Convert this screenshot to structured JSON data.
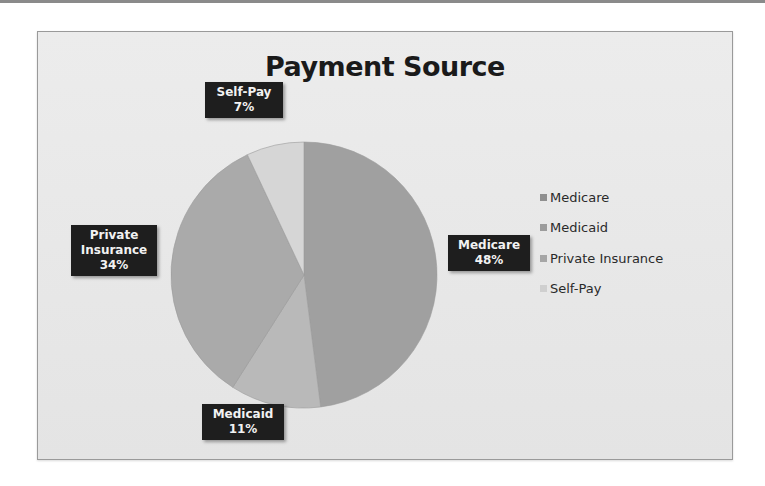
{
  "chart_data": {
    "type": "pie",
    "title": "Payment Source",
    "categories": [
      "Medicare",
      "Medicaid",
      "Private Insurance",
      "Self-Pay"
    ],
    "values": [
      48,
      11,
      34,
      7
    ],
    "unit": "%",
    "start_angle_deg": 0,
    "direction": "clockwise",
    "colors": [
      "#a0a0a0",
      "#b9b9b9",
      "#aaaaaa",
      "#d6d6d6"
    ],
    "data_labels": [
      {
        "category": "Medicare",
        "text": "Medicare",
        "value_text": "48%"
      },
      {
        "category": "Medicaid",
        "text": "Medicaid",
        "value_text": "11%"
      },
      {
        "category": "Private Insurance",
        "text_line1": "Private",
        "text_line2": "Insurance",
        "value_text": "34%"
      },
      {
        "category": "Self-Pay",
        "text": "Self-Pay",
        "value_text": "7%"
      }
    ],
    "legend": {
      "position": "right",
      "entries": [
        "Medicare",
        "Medicaid",
        "Private Insurance",
        "Self-Pay"
      ]
    }
  },
  "labels": {
    "medicare": {
      "name": "Medicare",
      "pct": "48%"
    },
    "medicaid": {
      "name": "Medicaid",
      "pct": "11%"
    },
    "private": {
      "line1": "Private",
      "line2": "Insurance",
      "pct": "34%"
    },
    "selfpay": {
      "name": "Self-Pay",
      "pct": "7%"
    }
  },
  "legend": {
    "items": [
      {
        "label": "Medicare",
        "color": "#8f8f8f"
      },
      {
        "label": "Medicaid",
        "color": "#9c9c9c"
      },
      {
        "label": "Private Insurance",
        "color": "#a6a6a6"
      },
      {
        "label": "Self-Pay",
        "color": "#cfcfcf"
      }
    ]
  }
}
